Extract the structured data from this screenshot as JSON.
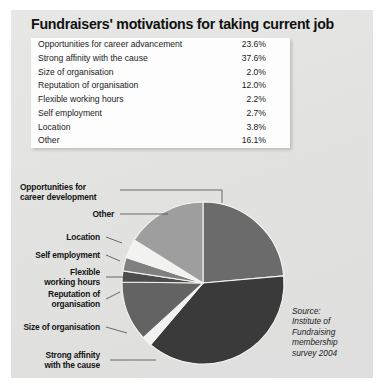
{
  "figure": {
    "title": "Fundraisers' motivations for taking current job",
    "background_color": "#e3e3e1",
    "source_note": "Source:\nInstitute of\nFundraising\nmembership\nsurvey 2004"
  },
  "table": {
    "columns": [
      "Motivation",
      "Percentage"
    ],
    "rows": [
      {
        "label": "Opportunities for career advancement",
        "value": "23.6%"
      },
      {
        "label": "Strong affinity with the cause",
        "value": "37.6%"
      },
      {
        "label": "Size of organisation",
        "value": "2.0%"
      },
      {
        "label": "Reputation of organisation",
        "value": "12.0%"
      },
      {
        "label": "Flexible working hours",
        "value": "2.2%"
      },
      {
        "label": "Self employment",
        "value": "2.7%"
      },
      {
        "label": "Location",
        "value": "3.8%"
      },
      {
        "label": "Other",
        "value": "16.1%"
      }
    ]
  },
  "pie_labels": [
    {
      "id": "opportunities",
      "text": "Opportunities for\ncareer development"
    },
    {
      "id": "other",
      "text": "Other"
    },
    {
      "id": "location",
      "text": "Location"
    },
    {
      "id": "self-employment",
      "text": "Self employment"
    },
    {
      "id": "flexible-hours",
      "text": "Flexible\nworking hours"
    },
    {
      "id": "reputation",
      "text": "Reputation of\norganisation"
    },
    {
      "id": "size",
      "text": "Size of organisation"
    },
    {
      "id": "strong-affinity",
      "text": "Strong affinity\nwith the cause"
    }
  ],
  "chart_data": {
    "type": "pie",
    "title": "Fundraisers' motivations for taking current job",
    "labels": [
      "Opportunities for career advancement",
      "Strong affinity with the cause",
      "Size of organisation",
      "Reputation of organisation",
      "Flexible working hours",
      "Self employment",
      "Location",
      "Other"
    ],
    "values": [
      23.6,
      37.6,
      2.0,
      12.0,
      2.2,
      2.7,
      3.8,
      16.1
    ],
    "unit": "%",
    "legend": "callout-labels-left",
    "start_angle_deg": 0,
    "direction": "clockwise",
    "slice_order": [
      "Opportunities for career advancement",
      "Strong affinity with the cause",
      "Size of organisation",
      "Reputation of organisation",
      "Flexible working hours",
      "Self employment",
      "Location",
      "Other"
    ],
    "colors": {
      "Opportunities for career advancement": "#6b6b6b",
      "Strong affinity with the cause": "#3a3a3a",
      "Size of organisation": "#f2f2f0",
      "Reputation of organisation": "#636363",
      "Flexible working hours": "#4d4d4d",
      "Self employment": "#808080",
      "Location": "#f2f2f0",
      "Other": "#9e9e9e"
    },
    "grid": false,
    "xlabel": "",
    "ylabel": ""
  }
}
